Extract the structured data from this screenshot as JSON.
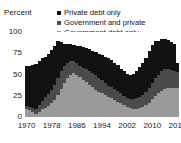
{
  "title_remnant": "",
  "axis": {
    "y_title": "Percent",
    "y_ticks": [
      "100",
      "75",
      "50",
      "25",
      "0"
    ],
    "x_ticks": [
      "1970",
      "1978",
      "1986",
      "1994",
      "2002",
      "2010",
      "2018"
    ]
  },
  "legend": {
    "items": [
      {
        "label": "Private debt only",
        "color": "#111111",
        "swatch_name": "legend-swatch-private"
      },
      {
        "label": "Government and private",
        "color": "#4a4a4a",
        "swatch_name": "legend-swatch-government-and-private"
      },
      {
        "label": "Government debt only",
        "color": "#9a9a9a",
        "swatch_name": "legend-swatch-government"
      }
    ]
  },
  "chart_data": {
    "type": "bar",
    "title": "",
    "subtitle": "",
    "xlabel": "",
    "ylabel": "Percent",
    "ylim": [
      0,
      100
    ],
    "xlim": [
      1970,
      2018
    ],
    "grid": false,
    "stacked": true,
    "legend_position": "top-right",
    "categories": [
      1970,
      1971,
      1972,
      1973,
      1974,
      1975,
      1976,
      1977,
      1978,
      1979,
      1980,
      1981,
      1982,
      1983,
      1984,
      1985,
      1986,
      1987,
      1988,
      1989,
      1990,
      1991,
      1992,
      1993,
      1994,
      1995,
      1996,
      1997,
      1998,
      1999,
      2000,
      2001,
      2002,
      2003,
      2004,
      2005,
      2006,
      2007,
      2008,
      2009,
      2010,
      2011,
      2012,
      2013,
      2014,
      2015,
      2016,
      2017,
      2018
    ],
    "series": [
      {
        "name": "Government debt only",
        "color": "#9a9a9a",
        "values": [
          10,
          8,
          6,
          4,
          6,
          9,
          11,
          13,
          16,
          20,
          26,
          33,
          40,
          46,
          50,
          52,
          50,
          47,
          44,
          41,
          38,
          35,
          32,
          30,
          28,
          26,
          24,
          22,
          20,
          18,
          16,
          14,
          12,
          11,
          10,
          10,
          11,
          12,
          14,
          17,
          21,
          25,
          28,
          31,
          33,
          34,
          34,
          34,
          34
        ]
      },
      {
        "name": "Government and private",
        "color": "#4a4a4a",
        "values": [
          3,
          4,
          5,
          6,
          8,
          10,
          12,
          14,
          16,
          18,
          20,
          21,
          20,
          18,
          16,
          14,
          13,
          13,
          14,
          15,
          16,
          17,
          17,
          16,
          15,
          14,
          13,
          13,
          13,
          13,
          12,
          11,
          10,
          10,
          11,
          12,
          13,
          14,
          15,
          17,
          19,
          21,
          22,
          23,
          23,
          22,
          21,
          20,
          19
        ]
      },
      {
        "name": "Private debt only",
        "color": "#111111",
        "values": [
          47,
          48,
          50,
          52,
          52,
          50,
          48,
          47,
          47,
          46,
          44,
          34,
          26,
          22,
          20,
          19,
          21,
          23,
          24,
          25,
          26,
          26,
          27,
          28,
          30,
          31,
          32,
          32,
          31,
          30,
          29,
          29,
          29,
          29,
          30,
          32,
          35,
          38,
          41,
          44,
          45,
          43,
          40,
          38,
          36,
          35,
          33,
          32,
          10
        ]
      }
    ]
  }
}
